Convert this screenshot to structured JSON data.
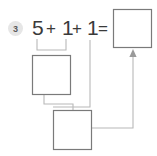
{
  "exercise": {
    "number": "3",
    "badge_fill": "#e6e6e6",
    "badge_text_color": "#5a5a5a"
  },
  "equation": {
    "terms": [
      "5",
      "+",
      "1",
      "+",
      "1",
      "="
    ],
    "first_addend": "5",
    "plus_1": "+",
    "unit_1": "1",
    "plus_2": "+",
    "unit_2": "1",
    "equals": "=",
    "text_color": "#3a3a3a"
  },
  "answer_boxes": {
    "result_box": {
      "label": "",
      "value": ""
    },
    "partial_box": {
      "label": "",
      "value": ""
    },
    "total_box": {
      "label": "",
      "value": ""
    }
  },
  "colors": {
    "box_stroke": "#7a7a7a",
    "connector_stroke": "#b8b8b8",
    "arrow_stroke": "#9a9a9a",
    "background": "#ffffff"
  },
  "icons": {
    "arrow": "arrow-up-icon",
    "bracket": "grouping-bracket-icon"
  }
}
